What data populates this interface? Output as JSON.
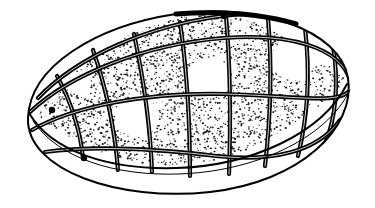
{
  "figure": {
    "title": "Ovoid object with curvilinear grid and stippled cells",
    "subject_name": "ovoid-body",
    "style": "black-and-white line drawing",
    "background_color": "#ffffff",
    "ink_color": "#000000",
    "stipple_color": "#1a1a1a",
    "canvas": {
      "width": 375,
      "height": 208
    }
  },
  "geometry": {
    "outline": {
      "name": "body-silhouette",
      "path": "M 28 118 C 30 66 96 26 176 14 C 258 2 340 30 348 78 C 356 128 300 182 210 192 C 118 202 26 170 28 118 Z",
      "stroke_width": 2.0,
      "fill": "#ffffff",
      "description": "Overall ovoid silhouette tilted with long axis running lower-left to upper-right."
    },
    "rim_edge": {
      "name": "rim-parting-line",
      "path": "M 29 113 C 52 152 110 170 176 168 C 250 166 322 134 347 84",
      "stroke_width": 2.0,
      "description": "Curve separating the textured upper dome from the plain lower band."
    },
    "rim_inner_shadow": {
      "name": "rim-inner-line",
      "path": "M 33 121 C 58 158 114 176 178 174 C 252 172 326 140 350 90",
      "stroke_width": 1.0,
      "description": "Secondary thin line just inside the rim giving the base thickness."
    },
    "top_ridge": {
      "name": "crown-dark-band",
      "path": "M 176 14 C 220 11 262 14 296 24",
      "stroke_width": 5.0,
      "description": "Solid dark thickening along the top crown of the silhouette."
    }
  },
  "grid": {
    "name": "surface-grid",
    "line_color": "#000000",
    "major_stroke_width": 4.2,
    "minor_stroke_width": 2.0,
    "longitudinal_label": "longitudinal-rib",
    "latitudinal_label": "latitudinal-rib",
    "longitudinal_count": 8,
    "latitudinal_count": 4,
    "longitudinals": [
      {
        "id": "rib-long-1",
        "path": "M 57 76 C 70 100 80 128 83 158"
      },
      {
        "id": "rib-long-2",
        "path": "M 93 50 C 104 82 114 120 118 170"
      },
      {
        "id": "rib-long-3",
        "path": "M 134 34 C 142 72 150 116 152 172"
      },
      {
        "id": "rib-long-4",
        "path": "M 180 22 C 186 64 190 116 190 176"
      },
      {
        "id": "rib-long-5",
        "path": "M 226 16 C 230 62 231 116 229 174"
      },
      {
        "id": "rib-long-6",
        "path": "M 268 18 C 272 64 271 114 265 166"
      },
      {
        "id": "rib-long-7",
        "path": "M 305 28 C 310 70 308 116 298 156"
      },
      {
        "id": "rib-long-8",
        "path": "M 333 46 C 339 82 336 118 325 144"
      }
    ],
    "latitudinals": [
      {
        "id": "rib-lat-1",
        "path": "M 38 98 C 78 56 148 26 222 16 C 286 8 332 24 347 62"
      },
      {
        "id": "rib-lat-2",
        "path": "M 30 112 C 70 74 146 44 224 38 C 292 33 340 48 350 80"
      },
      {
        "id": "rib-lat-3",
        "path": "M 32 130 C 74 106 148 92 226 94 C 294 96 336 104 348 92"
      },
      {
        "id": "rib-lat-4",
        "path": "M 45 152 C 88 146 150 148 216 156 C 272 162 318 152 340 120"
      }
    ],
    "convergence_nodes": [
      {
        "id": "node-left-apex",
        "x": 52,
        "y": 110
      },
      {
        "id": "node-left-lower",
        "x": 84,
        "y": 158
      },
      {
        "id": "node-top-crown",
        "x": 224,
        "y": 16
      }
    ]
  },
  "cells": {
    "name": "grid-cell-set",
    "total": 26,
    "stippled_count": 22,
    "plain_count": 4,
    "plain_cells": [
      {
        "id": "cell-plain-a",
        "center_x": 137,
        "center_y": 117,
        "note": "white cell left-of-centre"
      },
      {
        "id": "cell-plain-b",
        "center_x": 208,
        "center_y": 78,
        "note": "white cell centre-upper"
      },
      {
        "id": "cell-plain-c",
        "center_x": 293,
        "center_y": 60,
        "note": "white cell upper right"
      },
      {
        "id": "cell-plain-d",
        "center_x": 79,
        "center_y": 84,
        "note": "small white cell upper left"
      }
    ],
    "stipple": {
      "name": "stipple-texture",
      "dot_min_radius": 0.35,
      "dot_max_radius": 0.95,
      "density_per_1000px2": 42,
      "description": "Irregular fine dark flecks of varying size filling most cells."
    }
  },
  "lower_band": {
    "name": "base-band",
    "fill": "#ffffff",
    "description": "Smooth untextured band along the lower front of the body, bounded above by the rim line and below by the silhouette."
  }
}
